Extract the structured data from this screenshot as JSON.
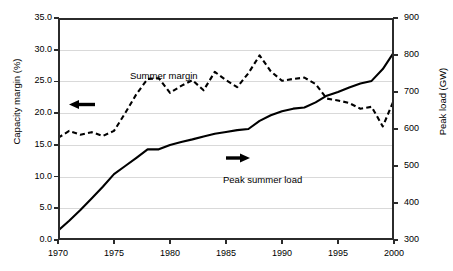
{
  "chart_data": {
    "type": "line",
    "title": "",
    "xlabel": "",
    "xlim": [
      1970,
      2000
    ],
    "x_ticks": [
      "1970",
      "1975",
      "1980",
      "1985",
      "1990",
      "1995",
      "2000"
    ],
    "grid": true,
    "legend_position": "inline-annotations",
    "axes": {
      "left": {
        "label": "Capacity margin (%)",
        "ylim": [
          0.0,
          35.0
        ],
        "ticks": [
          "0.0",
          "5.0",
          "10.0",
          "15.0",
          "20.0",
          "25.0",
          "30.0",
          "35.0"
        ]
      },
      "right": {
        "label": "Peak load (GW)",
        "ylim": [
          300,
          900
        ],
        "ticks": [
          "300",
          "400",
          "500",
          "600",
          "700",
          "800",
          "900"
        ]
      }
    },
    "series": [
      {
        "name": "Summer margin",
        "axis": "left",
        "style": "dashed",
        "color": "#000000",
        "unit": "%",
        "x": [
          1970,
          1971,
          1972,
          1973,
          1974,
          1975,
          1976,
          1977,
          1978,
          1979,
          1980,
          1981,
          1982,
          1983,
          1984,
          1985,
          1986,
          1987,
          1988,
          1989,
          1990,
          1991,
          1992,
          1993,
          1994,
          1995,
          1996,
          1997,
          1998,
          1999,
          2000
        ],
        "values": [
          16.1,
          17.2,
          16.6,
          17.0,
          16.4,
          17.2,
          20.0,
          23.0,
          25.4,
          25.5,
          23.2,
          24.3,
          25.2,
          23.6,
          26.5,
          25.2,
          24.1,
          26.3,
          29.1,
          26.6,
          25.1,
          25.4,
          25.6,
          24.6,
          22.3,
          22.0,
          21.6,
          20.7,
          21.0,
          17.9,
          22.1
        ]
      },
      {
        "name": "Peak summer load",
        "axis": "right",
        "style": "solid",
        "color": "#000000",
        "unit": "GW",
        "x": [
          1970,
          1971,
          1972,
          1973,
          1974,
          1975,
          1976,
          1977,
          1978,
          1979,
          1980,
          1981,
          1982,
          1983,
          1984,
          1985,
          1986,
          1987,
          1988,
          1989,
          1990,
          1991,
          1992,
          1993,
          1994,
          1995,
          1996,
          1997,
          1998,
          1999,
          2000
        ],
        "values": [
          325,
          352,
          381,
          412,
          444,
          478,
          500,
          522,
          545,
          545,
          557,
          565,
          572,
          580,
          587,
          592,
          597,
          600,
          622,
          637,
          648,
          655,
          658,
          672,
          690,
          700,
          712,
          723,
          730,
          762,
          808
        ]
      }
    ],
    "annotations": [
      {
        "name": "summer-margin-label",
        "text": "Summer margin",
        "points_to": "left-axis",
        "arrow": "left"
      },
      {
        "name": "peak-summer-load-label",
        "text": "Peak summer load",
        "points_to": "right-axis",
        "arrow": "right"
      }
    ]
  }
}
